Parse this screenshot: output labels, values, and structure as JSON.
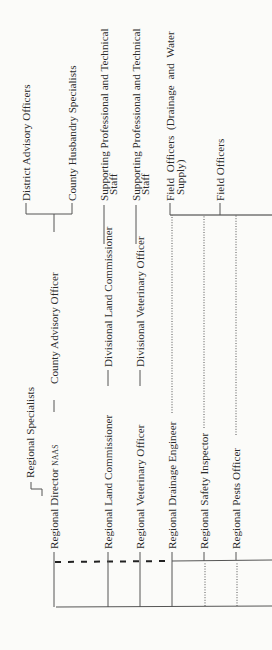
{
  "chart": {
    "orientation": "rotated-90-ccw",
    "regional": [
      {
        "id": "director",
        "label": "Regional Director",
        "suffix": "NAAS"
      },
      {
        "id": "specialists",
        "label": "Regional Specialists"
      },
      {
        "id": "land",
        "label": "Regional Land Commissioner"
      },
      {
        "id": "veterinary",
        "label": "Regional Veterinary Officer"
      },
      {
        "id": "drainage",
        "label": "Regional Drainage Engineer"
      },
      {
        "id": "safety",
        "label": "Regional Safety Inspector"
      },
      {
        "id": "pests",
        "label": "Regional Pests Officer"
      }
    ],
    "divisional": [
      {
        "id": "county_advisory",
        "label": "County Advisory Officer"
      },
      {
        "id": "div_land",
        "label": "Divisional Land Commissioner"
      },
      {
        "id": "div_vet",
        "label": "Divisional Veterinary Officer"
      }
    ],
    "field": [
      {
        "id": "district_advisory",
        "label": "District Advisory Officers"
      },
      {
        "id": "county_husbandry",
        "label": "County Husbandry Specialists"
      },
      {
        "id": "support_land_1",
        "label": "Supporting Professional and Technical",
        "label2": "Staff"
      },
      {
        "id": "support_vet_1",
        "label": "Supporting Professional and Technical",
        "label2": "Staff"
      },
      {
        "id": "field_drainage",
        "label": "Field Officers (Drainage and Water",
        "label2": "Supply)"
      },
      {
        "id": "field_officers",
        "label": "Field Officers"
      }
    ]
  }
}
